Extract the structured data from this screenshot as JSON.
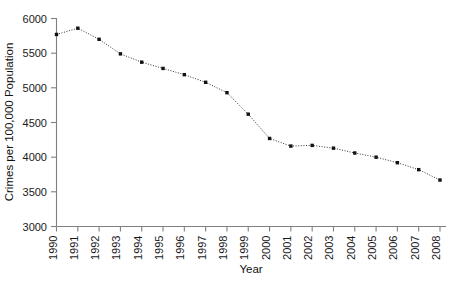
{
  "chart_data": {
    "type": "line",
    "title": "",
    "subtitle": "",
    "xlabel": "Year",
    "ylabel": "Crimes per 100,000 Population",
    "categories": [
      1990,
      1991,
      1992,
      1993,
      1994,
      1995,
      1996,
      1997,
      1998,
      1999,
      2000,
      2001,
      2002,
      2003,
      2004,
      2005,
      2006,
      2007,
      2008
    ],
    "x_tick_labels": [
      "1990",
      "1991",
      "1992",
      "1993",
      "1994",
      "1995",
      "1996",
      "1997",
      "1998",
      "1999",
      "2000",
      "2001",
      "2002",
      "2003",
      "2004",
      "2005",
      "2006",
      "2007",
      "2008"
    ],
    "values": [
      5770,
      5860,
      5700,
      5490,
      5370,
      5280,
      5190,
      5080,
      4930,
      4620,
      4270,
      4160,
      4170,
      4130,
      4060,
      4000,
      3920,
      3820,
      3670
    ],
    "y_tick_labels": [
      "3000",
      "3500",
      "4000",
      "4500",
      "5000",
      "5500",
      "6000"
    ],
    "y_ticks": [
      3000,
      3500,
      4000,
      4500,
      5000,
      5500,
      6000
    ],
    "ylim": [
      3000,
      6000
    ],
    "xlim": [
      1990,
      2008
    ],
    "grid": false,
    "legend": null,
    "legend_position": "none",
    "marker": "square",
    "line_style": "dotted",
    "series_color": "#222222",
    "axis_color": "#808080"
  }
}
